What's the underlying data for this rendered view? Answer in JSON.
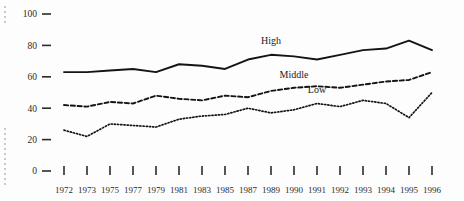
{
  "chart_data": {
    "type": "line",
    "title": "",
    "subtitle": "",
    "xlabel": "",
    "ylabel": "",
    "categories": [
      "1972",
      "1973",
      "1975",
      "1977",
      "1979",
      "1981",
      "1983",
      "1985",
      "1987",
      "1989",
      "1990",
      "1991",
      "1992",
      "1993",
      "1994",
      "1995",
      "1996"
    ],
    "x_tick_labels": [
      "1972",
      "1973",
      "1975",
      "1977",
      "1979",
      "1981",
      "1983",
      "1985",
      "1987",
      "1989",
      "1990",
      "1991",
      "1992",
      "1993",
      "1994",
      "1995",
      "1996"
    ],
    "y_tick_labels": [
      "0",
      "20",
      "40",
      "60",
      "80",
      "100"
    ],
    "y_ticks": [
      0,
      20,
      40,
      60,
      80,
      100
    ],
    "ylim": [
      0,
      100
    ],
    "grid": false,
    "legend": "inline-labels",
    "legend_position": "right-inline",
    "series": [
      {
        "name": "High",
        "style": "solid",
        "label_x_category": "1989",
        "values": [
          63,
          63,
          64,
          65,
          63,
          68,
          67,
          65,
          71,
          74,
          73,
          71,
          74,
          77,
          78,
          83,
          77
        ]
      },
      {
        "name": "Middle",
        "style": "dashed",
        "label_x_category": "1990",
        "values": [
          42,
          41,
          44,
          43,
          48,
          46,
          45,
          48,
          47,
          51,
          53,
          54,
          53,
          55,
          57,
          58,
          63
        ]
      },
      {
        "name": "Low",
        "style": "dotted",
        "label_x_category": "1991",
        "values": [
          26,
          22,
          30,
          29,
          28,
          33,
          35,
          36,
          40,
          37,
          39,
          43,
          41,
          45,
          43,
          34,
          50
        ]
      }
    ],
    "annotations": []
  },
  "axes": {
    "y_axis_name": "y-axis",
    "x_axis_name": "x-axis"
  },
  "colors": {
    "background": "#fdfdfd",
    "ink": "#141414",
    "tick": "#2b2b2b",
    "speck": "#c9c9c9"
  }
}
